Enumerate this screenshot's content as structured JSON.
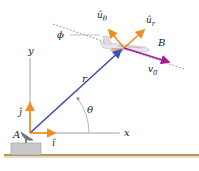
{
  "diagram": {
    "points": {
      "A": {
        "label": "A",
        "x": 30,
        "y": 133
      },
      "B": {
        "label": "B",
        "x": 123,
        "y": 48
      }
    },
    "axes": {
      "x_label": "x",
      "y_label": "y",
      "color": "#8a8a8a"
    },
    "vectors": {
      "r": {
        "label": "r",
        "color": "#3b4fb0"
      },
      "i_hat": {
        "label": "î",
        "color": "#f28c1e"
      },
      "j_hat": {
        "label": "ĵ",
        "color": "#f28c1e"
      },
      "u_r": {
        "label": "û",
        "sub": "r",
        "color": "#f28c1e"
      },
      "u_theta": {
        "label": "û",
        "sub": "θ",
        "color": "#f28c1e"
      },
      "v0": {
        "label": "v",
        "sub": "0",
        "color": "#a3208c"
      }
    },
    "angles": {
      "theta": {
        "label": "θ"
      },
      "phi": {
        "label": "ϕ"
      }
    },
    "ground": {
      "color": "#b8955a",
      "platform_color": "#c8c8c8"
    }
  }
}
